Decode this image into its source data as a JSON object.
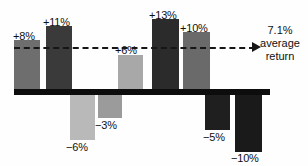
{
  "chart_data": {
    "type": "bar",
    "title": "",
    "subtitle": "",
    "xlabel": "",
    "ylabel": "",
    "ylim": [
      -12,
      15
    ],
    "grid": false,
    "legend_position": "none",
    "categories": [
      "1",
      "2",
      "3",
      "4",
      "5",
      "6",
      "7",
      "8",
      "9"
    ],
    "values": [
      8,
      11,
      -6,
      -3,
      6,
      13,
      10,
      -5,
      -10
    ],
    "value_labels": [
      "+8%",
      "+11%",
      "−6%",
      "−3%",
      "+6%",
      "+13%",
      "+10%",
      "−5%",
      "−10%"
    ],
    "bar_colors": [
      "#6e6e6e",
      "#3a3a3a",
      "#b9b9b9",
      "#9b9b9b",
      "#a8a8a8",
      "#2b2b2b",
      "#6a6a6a",
      "#1f1f1f",
      "#1a1a1a"
    ],
    "reference_line": {
      "value": 7.1,
      "style": "dashed",
      "label_value": "7.1%",
      "label_line1": "average",
      "label_line2": "return",
      "color": "#161616"
    },
    "axis_color": "#0d0d0d",
    "background": "#fefefe"
  },
  "bars": [
    {
      "label": "+8%",
      "x": 14,
      "w": 26,
      "top": 40,
      "h": 51,
      "color": "#6e6e6e",
      "lx": 13,
      "ly": 30
    },
    {
      "label": "+11%",
      "x": 46,
      "w": 26,
      "top": 26,
      "h": 65,
      "color": "#3a3a3a",
      "lx": 43,
      "ly": 16
    },
    {
      "label": "−6%",
      "x": 70,
      "w": 25,
      "top": 95,
      "h": 45,
      "color": "#b9b9b9",
      "lx": 66,
      "ly": 141
    },
    {
      "label": "−3%",
      "x": 98,
      "w": 24,
      "top": 95,
      "h": 23,
      "color": "#9b9b9b",
      "lx": 95,
      "ly": 119
    },
    {
      "label": "+6%",
      "x": 118,
      "w": 25,
      "top": 55,
      "h": 36,
      "color": "#a8a8a8",
      "lx": 115,
      "ly": 44
    },
    {
      "label": "+13%",
      "x": 152,
      "w": 27,
      "top": 19,
      "h": 72,
      "color": "#2b2b2b",
      "lx": 149,
      "ly": 9
    },
    {
      "label": "+10%",
      "x": 183,
      "w": 27,
      "top": 32,
      "h": 59,
      "color": "#6a6a6a",
      "lx": 180,
      "ly": 22
    },
    {
      "label": "−5%",
      "x": 205,
      "w": 25,
      "top": 95,
      "h": 35,
      "color": "#1f1f1f",
      "lx": 203,
      "ly": 131
    },
    {
      "label": "−10%",
      "x": 235,
      "w": 27,
      "top": 95,
      "h": 57,
      "color": "#1a1a1a",
      "lx": 231,
      "ly": 152
    }
  ],
  "axis": {
    "x": 14,
    "y": 89,
    "width": 256,
    "height": 6
  },
  "avg_line": {
    "x": 14,
    "y": 47,
    "width": 241
  },
  "avg_arrow": {
    "x": 252,
    "y": 42
  },
  "annotation": {
    "x": 254,
    "y": 24,
    "width": 52,
    "value": "7.1%",
    "line1": "average",
    "line2": "return"
  }
}
